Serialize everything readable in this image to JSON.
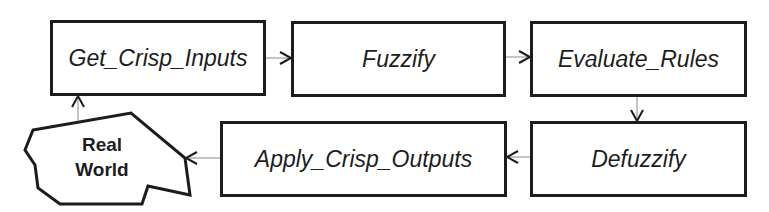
{
  "diagram": {
    "type": "flowchart",
    "nodes": [
      {
        "id": "get_crisp_inputs",
        "label": "Get_Crisp_Inputs"
      },
      {
        "id": "fuzzify",
        "label": "Fuzzify"
      },
      {
        "id": "evaluate_rules",
        "label": "Evaluate_Rules"
      },
      {
        "id": "defuzzify",
        "label": "Defuzzify"
      },
      {
        "id": "apply_crisp_outputs",
        "label": "Apply_Crisp_Outputs"
      },
      {
        "id": "real_world",
        "label_line1": "Real",
        "label_line2": "World",
        "shape": "irregular-polygon"
      }
    ],
    "edges": [
      {
        "from": "get_crisp_inputs",
        "to": "fuzzify"
      },
      {
        "from": "fuzzify",
        "to": "evaluate_rules"
      },
      {
        "from": "evaluate_rules",
        "to": "defuzzify"
      },
      {
        "from": "defuzzify",
        "to": "apply_crisp_outputs"
      },
      {
        "from": "apply_crisp_outputs",
        "to": "real_world"
      },
      {
        "from": "real_world",
        "to": "get_crisp_inputs"
      }
    ],
    "colors": {
      "stroke": "#1c1c1c",
      "connector": "#8a8a8a",
      "text": "#1e1e1e",
      "background": "#ffffff"
    }
  }
}
